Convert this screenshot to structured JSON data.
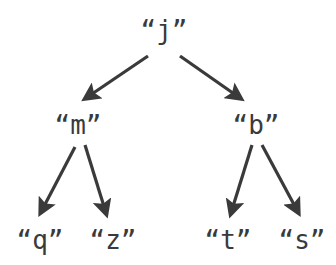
{
  "diagram": {
    "type": "binary-tree",
    "colors": {
      "text": "#3a3a3a",
      "edge": "#3a3a3a",
      "background": "#ffffff"
    },
    "nodes": [
      {
        "id": "root",
        "label": "“j”",
        "x": 164,
        "y": 30
      },
      {
        "id": "left",
        "label": "“m”",
        "x": 78,
        "y": 125
      },
      {
        "id": "right",
        "label": "“b”",
        "x": 256,
        "y": 125
      },
      {
        "id": "left-left",
        "label": "“q”",
        "x": 40,
        "y": 240
      },
      {
        "id": "left-right",
        "label": "“z”",
        "x": 113,
        "y": 240
      },
      {
        "id": "right-left",
        "label": "“t”",
        "x": 228,
        "y": 240
      },
      {
        "id": "right-right",
        "label": "“s”",
        "x": 302,
        "y": 240
      }
    ],
    "edges": [
      {
        "from": "root",
        "to": "left",
        "x1": 148,
        "y1": 56,
        "x2": 86,
        "y2": 98
      },
      {
        "from": "root",
        "to": "right",
        "x1": 180,
        "y1": 56,
        "x2": 240,
        "y2": 98
      },
      {
        "from": "left",
        "to": "left-left",
        "x1": 75,
        "y1": 147,
        "x2": 41,
        "y2": 212
      },
      {
        "from": "left",
        "to": "left-right",
        "x1": 85,
        "y1": 145,
        "x2": 106,
        "y2": 213
      },
      {
        "from": "right",
        "to": "right-left",
        "x1": 252,
        "y1": 145,
        "x2": 231,
        "y2": 213
      },
      {
        "from": "right",
        "to": "right-right",
        "x1": 262,
        "y1": 145,
        "x2": 298,
        "y2": 212
      }
    ]
  }
}
